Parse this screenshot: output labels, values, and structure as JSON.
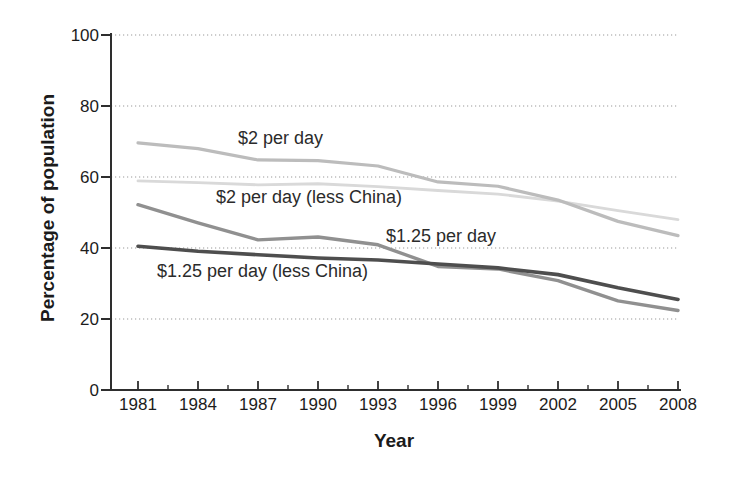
{
  "chart_data": {
    "type": "line",
    "title": "",
    "xlabel": "Year",
    "ylabel": "Percentage of population",
    "x": [
      1981,
      1984,
      1987,
      1990,
      1993,
      1996,
      1999,
      2002,
      2005,
      2008
    ],
    "x_tick_labels": [
      "1981",
      "1984",
      "1987",
      "1990",
      "1993",
      "1996",
      "1999",
      "2002",
      "2005",
      "2008"
    ],
    "y_ticks": [
      0,
      20,
      40,
      60,
      80,
      100
    ],
    "y_tick_labels": [
      "0",
      "20",
      "40",
      "60",
      "80",
      "100"
    ],
    "ylim": [
      0,
      100
    ],
    "grid": "horizontal-dotted",
    "has_minor_x_ticks": true,
    "legend": "inline-labels-on-plot",
    "background": "#ffffff",
    "axis_color": "#2e2e2e",
    "grid_color": "#999999",
    "tick_label_color": "#1c1c1c",
    "series": [
      {
        "name": "$2 per day",
        "color": "#bcbcbc",
        "stroke_width": 3.2,
        "values": [
          69.6,
          68.0,
          64.8,
          64.6,
          63.1,
          58.6,
          57.4,
          53.5,
          47.5,
          43.5
        ]
      },
      {
        "name": "$2 per day (less China)",
        "color": "#d9d9d9",
        "stroke_width": 2.8,
        "values": [
          58.9,
          58.4,
          57.8,
          58.1,
          57.3,
          56.2,
          55.2,
          53.2,
          50.5,
          48.0
        ]
      },
      {
        "name": "$1.25 per day",
        "color": "#909090",
        "stroke_width": 3.4,
        "values": [
          52.2,
          47.1,
          42.3,
          43.1,
          40.9,
          34.8,
          34.1,
          30.8,
          25.1,
          22.4
        ]
      },
      {
        "name": "$1.25 per day (less China)",
        "color": "#4e4e4e",
        "stroke_width": 3.6,
        "values": [
          40.5,
          39.1,
          38.1,
          37.2,
          36.6,
          35.5,
          34.4,
          32.5,
          28.8,
          25.5
        ]
      }
    ],
    "annotations": [
      {
        "text": "$2 per day",
        "labels_series": "$2 per day"
      },
      {
        "text": "$2 per day (less China)",
        "labels_series": "$2 per day (less China)"
      },
      {
        "text": "$1.25 per day",
        "labels_series": "$1.25 per day"
      },
      {
        "text": "$1.25 per day (less China)",
        "labels_series": "$1.25 per day (less China)"
      }
    ]
  }
}
